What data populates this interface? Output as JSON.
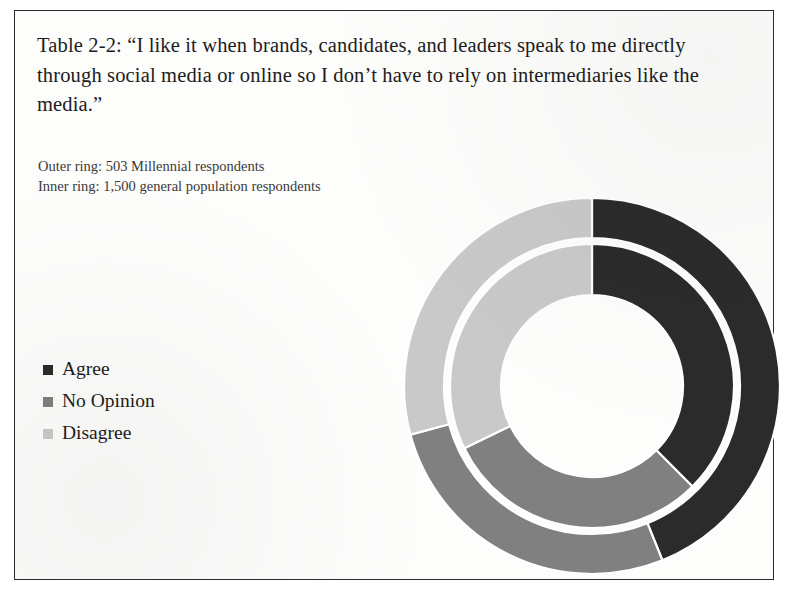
{
  "title": "Table 2-2: “I like it when brands, candidates, and leaders speak to me directly through social media or online so I don’t have to rely on intermediaries like the media.”",
  "subtitle": {
    "outer_ring": "Outer ring: 503 Millennial respondents",
    "inner_ring": "Inner ring: 1,500 general population respondents"
  },
  "legend": {
    "items": [
      {
        "label": "Agree",
        "color": "#2b2b2b"
      },
      {
        "label": "No Opinion",
        "color": "#808080"
      },
      {
        "label": "Disagree",
        "color": "#c9c9c9"
      }
    ]
  },
  "colors": {
    "agree": "#2b2b2b",
    "no_opinion": "#808080",
    "disagree": "#c9c9c9",
    "separator": "#ffffff",
    "page_border": "#2b2b2b",
    "text": "#1c1c1c"
  },
  "chart_data": {
    "type": "pie",
    "variant": "nested-donut",
    "title": "Table 2-2: “I like it when brands, candidates, and leaders speak to me directly through social media or online so I don’t have to rely on intermediaries like the media.”",
    "categories": [
      "Agree",
      "No Opinion",
      "Disagree"
    ],
    "legend_position": "left",
    "grid": false,
    "start_angle_deg": 0,
    "direction": "clockwise",
    "rings": [
      {
        "name": "Outer ring",
        "description": "503 Millennial respondents",
        "n": 503,
        "radius_outer_px": 188,
        "radius_inner_px": 148,
        "values": [
          44,
          27,
          29
        ],
        "slices": [
          {
            "label": "Agree",
            "value": 44,
            "angle_deg": 158,
            "color": "#2b2b2b"
          },
          {
            "label": "No Opinion",
            "value": 27,
            "angle_deg": 97,
            "color": "#808080"
          },
          {
            "label": "Disagree",
            "value": 29,
            "angle_deg": 105,
            "color": "#c9c9c9"
          }
        ]
      },
      {
        "name": "Inner ring",
        "description": "1,500 general population respondents",
        "n": 1500,
        "radius_outer_px": 142,
        "radius_inner_px": 91,
        "values": [
          38,
          30,
          32
        ],
        "slices": [
          {
            "label": "Agree",
            "value": 38,
            "angle_deg": 135,
            "color": "#2b2b2b"
          },
          {
            "label": "No Opinion",
            "value": 30,
            "angle_deg": 109,
            "color": "#808080"
          },
          {
            "label": "Disagree",
            "value": 32,
            "angle_deg": 116,
            "color": "#c9c9c9"
          }
        ]
      }
    ]
  }
}
